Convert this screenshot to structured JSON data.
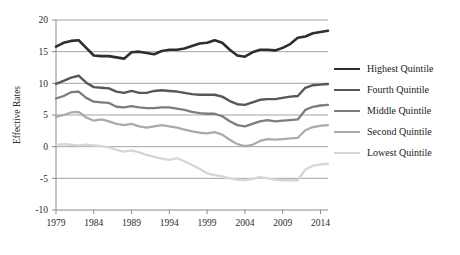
{
  "chart_data": {
    "type": "line",
    "title": "",
    "xlabel": "",
    "ylabel": "Effective Rates",
    "xlim": [
      1979,
      2015
    ],
    "ylim": [
      -10,
      20
    ],
    "grid": true,
    "legend_position": "right",
    "xticks": [
      "1979",
      "1984",
      "1989",
      "1994",
      "1999",
      "2004",
      "2009",
      "2014"
    ],
    "xtick_values": [
      1979,
      1984,
      1989,
      1994,
      1999,
      2004,
      2009,
      2014
    ],
    "yticks": [
      "20",
      "15",
      "10",
      "5",
      "0",
      "-5",
      "-10"
    ],
    "ytick_values": [
      20,
      15,
      10,
      5,
      0,
      -5,
      -10
    ],
    "x": [
      1979,
      1980,
      1981,
      1982,
      1983,
      1984,
      1985,
      1986,
      1987,
      1988,
      1989,
      1990,
      1991,
      1992,
      1993,
      1994,
      1995,
      1996,
      1997,
      1998,
      1999,
      2000,
      2001,
      2002,
      2003,
      2004,
      2005,
      2006,
      2007,
      2008,
      2009,
      2010,
      2011,
      2012,
      2013,
      2014,
      2015
    ],
    "series": [
      {
        "name": "Highest Quintile",
        "color": "#2e2e2e",
        "width": 2.6,
        "values": [
          15.8,
          16.4,
          16.7,
          16.8,
          15.6,
          14.4,
          14.3,
          14.3,
          14.1,
          13.9,
          14.9,
          15.0,
          14.8,
          14.6,
          15.1,
          15.3,
          15.3,
          15.5,
          15.9,
          16.3,
          16.4,
          16.8,
          16.4,
          15.3,
          14.4,
          14.2,
          14.9,
          15.3,
          15.3,
          15.2,
          15.6,
          16.2,
          17.2,
          17.4,
          17.9,
          18.1,
          18.3
        ]
      },
      {
        "name": "Fourth Quintile",
        "color": "#575757",
        "width": 2.4,
        "values": [
          9.9,
          10.4,
          10.9,
          11.2,
          10.1,
          9.4,
          9.3,
          9.2,
          8.7,
          8.5,
          8.8,
          8.5,
          8.5,
          8.8,
          8.9,
          8.8,
          8.7,
          8.5,
          8.3,
          8.2,
          8.2,
          8.2,
          7.9,
          7.2,
          6.7,
          6.6,
          7.0,
          7.4,
          7.5,
          7.5,
          7.7,
          7.9,
          8.0,
          9.3,
          9.7,
          9.8,
          9.9
        ]
      },
      {
        "name": "Middle Quintile",
        "color": "#7d7d7d",
        "width": 2.3,
        "values": [
          7.6,
          8.0,
          8.6,
          8.7,
          7.7,
          7.1,
          7.0,
          6.9,
          6.3,
          6.2,
          6.4,
          6.2,
          6.1,
          6.1,
          6.2,
          6.2,
          6.0,
          5.8,
          5.5,
          5.3,
          5.2,
          5.2,
          4.8,
          4.0,
          3.4,
          3.2,
          3.6,
          4.0,
          4.2,
          4.0,
          4.1,
          4.2,
          4.3,
          5.8,
          6.3,
          6.5,
          6.6
        ]
      },
      {
        "name": "Second Quintile",
        "color": "#ababab",
        "width": 2.3,
        "values": [
          4.7,
          5.0,
          5.4,
          5.5,
          4.6,
          4.1,
          4.3,
          4.0,
          3.6,
          3.4,
          3.6,
          3.2,
          3.0,
          3.2,
          3.4,
          3.2,
          3.0,
          2.7,
          2.4,
          2.2,
          2.1,
          2.3,
          1.9,
          1.1,
          0.4,
          0.1,
          0.3,
          0.9,
          1.2,
          1.1,
          1.2,
          1.3,
          1.4,
          2.6,
          3.1,
          3.3,
          3.4
        ]
      },
      {
        "name": "Lowest Quintile",
        "color": "#d6d6d6",
        "width": 2.3,
        "values": [
          0.3,
          0.4,
          0.3,
          0.2,
          0.3,
          0.2,
          0.1,
          -0.1,
          -0.5,
          -0.8,
          -0.6,
          -0.9,
          -1.3,
          -1.6,
          -1.9,
          -2.1,
          -1.8,
          -2.3,
          -2.9,
          -3.5,
          -4.2,
          -4.5,
          -4.7,
          -5.0,
          -5.2,
          -5.3,
          -5.1,
          -4.8,
          -5.0,
          -5.2,
          -5.3,
          -5.3,
          -5.3,
          -3.6,
          -3.0,
          -2.8,
          -2.7
        ]
      }
    ]
  },
  "legend": {
    "items": [
      {
        "label": "Highest Quintile"
      },
      {
        "label": "Fourth Quintile"
      },
      {
        "label": "Middle Quintile"
      },
      {
        "label": "Second Quintile"
      },
      {
        "label": "Lowest Quintile"
      }
    ]
  }
}
